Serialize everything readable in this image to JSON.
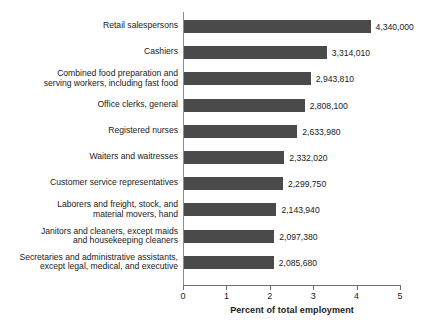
{
  "chart_data": {
    "type": "bar",
    "orientation": "horizontal",
    "title": "",
    "subtitle": "",
    "xlabel": "Percent of total employment",
    "ylabel": "",
    "xlim": [
      0,
      5
    ],
    "xticks": [
      0,
      1,
      2,
      3,
      4,
      5
    ],
    "xtick_labels": [
      "0",
      "1",
      "2",
      "3",
      "4",
      "5"
    ],
    "grid": false,
    "legend": null,
    "bar_color": "#4a4a4a",
    "categories": [
      "Retail salespersons",
      "Cashiers",
      "Combined food preparation and\nserving workers, including fast food",
      "Office clerks, general",
      "Registered nurses",
      "Waiters and waitresses",
      "Customer service representatives",
      "Laborers and freight, stock, and\nmaterial movers, hand",
      "Janitors and cleaners, except maids\nand housekeeping cleaners",
      "Secretaries and administrative assistants,\nexcept legal, medical, and executive"
    ],
    "values": [
      4.3,
      3.29,
      2.92,
      2.78,
      2.61,
      2.31,
      2.28,
      2.13,
      2.08,
      2.07
    ],
    "data_labels": [
      "4,340,000",
      "3,314,010",
      "2,943,810",
      "2,808,100",
      "2,633,980",
      "2,332,020",
      "2,299,750",
      "2,143,940",
      "2,097,380",
      "2,085,680"
    ],
    "employment_counts": [
      4340000,
      3314010,
      2943810,
      2808100,
      2633980,
      2332020,
      2299750,
      2143940,
      2097380,
      2085680
    ]
  }
}
